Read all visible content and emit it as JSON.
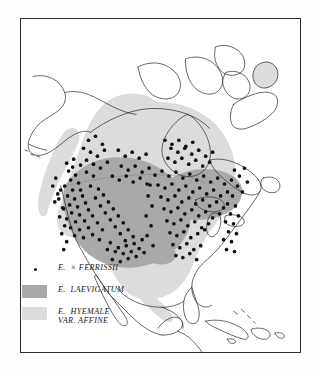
{
  "figure": {
    "type": "distribution-map",
    "region": "North America",
    "background_color": "#fefefe",
    "frame_color": "#2b2b2b",
    "coastline_color": "#333333"
  },
  "colors": {
    "dark_range": "#a9a9a9",
    "light_range": "#dcdcdc",
    "dot": "#111111",
    "land_outline": "#333333",
    "water": "#ffffff"
  },
  "legend": {
    "items": [
      {
        "key_type": "dot",
        "key_color": "#111111",
        "label": "E.  × FERRISSII",
        "label_line2": ""
      },
      {
        "key_type": "swatch",
        "key_color": "#a9a9a9",
        "label": "E.  LAEVIGATUM",
        "label_line2": ""
      },
      {
        "key_type": "swatch",
        "key_color": "#dcdcdc",
        "label": "E.  HYEMALE",
        "label_line2": "VAR. AFFINE"
      }
    ]
  },
  "chart_data": {
    "type": "map",
    "title": "",
    "taxa": [
      {
        "name": "E. × ferrissii",
        "symbol": "dot",
        "count_approx": 185
      },
      {
        "name": "E. laevigatum",
        "symbol": "dark-gray-shading"
      },
      {
        "name": "E. hyemale var. affine",
        "symbol": "light-gray-shading"
      }
    ],
    "dot_points": [
      [
        68,
        171
      ],
      [
        72,
        167
      ],
      [
        75,
        175
      ],
      [
        70,
        180
      ],
      [
        78,
        183
      ],
      [
        64,
        186
      ],
      [
        72,
        190
      ],
      [
        80,
        190
      ],
      [
        67,
        196
      ],
      [
        74,
        199
      ],
      [
        82,
        196
      ],
      [
        69,
        205
      ],
      [
        77,
        207
      ],
      [
        85,
        203
      ],
      [
        63,
        209
      ],
      [
        71,
        213
      ],
      [
        79,
        215
      ],
      [
        88,
        210
      ],
      [
        66,
        219
      ],
      [
        75,
        222
      ],
      [
        84,
        221
      ],
      [
        92,
        216
      ],
      [
        70,
        228
      ],
      [
        79,
        230
      ],
      [
        88,
        228
      ],
      [
        97,
        223
      ],
      [
        74,
        236
      ],
      [
        83,
        238
      ],
      [
        92,
        235
      ],
      [
        66,
        163
      ],
      [
        73,
        159
      ],
      [
        80,
        165
      ],
      [
        86,
        172
      ],
      [
        93,
        176
      ],
      [
        90,
        186
      ],
      [
        98,
        189
      ],
      [
        95,
        198
      ],
      [
        103,
        195
      ],
      [
        100,
        206
      ],
      [
        108,
        202
      ],
      [
        105,
        213
      ],
      [
        113,
        209
      ],
      [
        110,
        220
      ],
      [
        118,
        216
      ],
      [
        115,
        227
      ],
      [
        123,
        223
      ],
      [
        120,
        234
      ],
      [
        128,
        230
      ],
      [
        125,
        241
      ],
      [
        133,
        237
      ],
      [
        102,
        230
      ],
      [
        110,
        243
      ],
      [
        118,
        248
      ],
      [
        126,
        246
      ],
      [
        134,
        244
      ],
      [
        142,
        240
      ],
      [
        99,
        240
      ],
      [
        107,
        250
      ],
      [
        115,
        252
      ],
      [
        123,
        254
      ],
      [
        131,
        252
      ],
      [
        139,
        249
      ],
      [
        112,
        260
      ],
      [
        120,
        262
      ],
      [
        128,
        259
      ],
      [
        136,
        257
      ],
      [
        144,
        253
      ],
      [
        60,
        190
      ],
      [
        58,
        199
      ],
      [
        62,
        208
      ],
      [
        59,
        217
      ],
      [
        64,
        226
      ],
      [
        61,
        234
      ],
      [
        66,
        242
      ],
      [
        63,
        250
      ],
      [
        155,
        175
      ],
      [
        162,
        171
      ],
      [
        169,
        176
      ],
      [
        176,
        172
      ],
      [
        183,
        178
      ],
      [
        190,
        174
      ],
      [
        197,
        180
      ],
      [
        204,
        176
      ],
      [
        211,
        182
      ],
      [
        218,
        178
      ],
      [
        225,
        184
      ],
      [
        232,
        180
      ],
      [
        158,
        185
      ],
      [
        165,
        188
      ],
      [
        172,
        184
      ],
      [
        179,
        190
      ],
      [
        186,
        186
      ],
      [
        193,
        192
      ],
      [
        200,
        188
      ],
      [
        207,
        194
      ],
      [
        214,
        190
      ],
      [
        221,
        196
      ],
      [
        228,
        192
      ],
      [
        161,
        197
      ],
      [
        168,
        200
      ],
      [
        175,
        196
      ],
      [
        182,
        202
      ],
      [
        189,
        198
      ],
      [
        196,
        204
      ],
      [
        203,
        200
      ],
      [
        210,
        206
      ],
      [
        217,
        202
      ],
      [
        224,
        208
      ],
      [
        164,
        209
      ],
      [
        171,
        212
      ],
      [
        178,
        208
      ],
      [
        185,
        214
      ],
      [
        192,
        210
      ],
      [
        199,
        216
      ],
      [
        206,
        212
      ],
      [
        213,
        218
      ],
      [
        220,
        214
      ],
      [
        167,
        221
      ],
      [
        174,
        224
      ],
      [
        181,
        220
      ],
      [
        188,
        226
      ],
      [
        195,
        222
      ],
      [
        202,
        228
      ],
      [
        209,
        224
      ],
      [
        170,
        233
      ],
      [
        177,
        236
      ],
      [
        184,
        232
      ],
      [
        191,
        238
      ],
      [
        198,
        234
      ],
      [
        205,
        230
      ],
      [
        173,
        245
      ],
      [
        180,
        248
      ],
      [
        187,
        244
      ],
      [
        194,
        250
      ],
      [
        201,
        246
      ],
      [
        176,
        256
      ],
      [
        183,
        258
      ],
      [
        190,
        254
      ],
      [
        197,
        260
      ],
      [
        150,
        185
      ],
      [
        148,
        196
      ],
      [
        152,
        206
      ],
      [
        146,
        216
      ],
      [
        151,
        226
      ],
      [
        147,
        236
      ],
      [
        153,
        246
      ],
      [
        235,
        170
      ],
      [
        240,
        176
      ],
      [
        245,
        168
      ],
      [
        238,
        186
      ],
      [
        243,
        192
      ],
      [
        248,
        182
      ],
      [
        233,
        196
      ],
      [
        228,
        204
      ],
      [
        236,
        206
      ],
      [
        231,
        214
      ],
      [
        239,
        216
      ],
      [
        226,
        222
      ],
      [
        234,
        224
      ],
      [
        229,
        232
      ],
      [
        237,
        234
      ],
      [
        224,
        240
      ],
      [
        232,
        242
      ],
      [
        227,
        250
      ],
      [
        235,
        252
      ],
      [
        88,
        140
      ],
      [
        95,
        136
      ],
      [
        102,
        144
      ],
      [
        83,
        148
      ],
      [
        90,
        152
      ],
      [
        97,
        156
      ],
      [
        104,
        150
      ],
      [
        86,
        160
      ],
      [
        93,
        164
      ],
      [
        100,
        168
      ],
      [
        107,
        162
      ],
      [
        118,
        150
      ],
      [
        125,
        156
      ],
      [
        132,
        152
      ],
      [
        139,
        158
      ],
      [
        146,
        154
      ],
      [
        121,
        166
      ],
      [
        128,
        170
      ],
      [
        135,
        166
      ],
      [
        142,
        172
      ],
      [
        149,
        168
      ],
      [
        112,
        176
      ],
      [
        119,
        180
      ],
      [
        126,
        176
      ],
      [
        133,
        182
      ],
      [
        140,
        178
      ],
      [
        147,
        184
      ],
      [
        55,
        178
      ],
      [
        52,
        186
      ],
      [
        57,
        194
      ],
      [
        54,
        202
      ],
      [
        168,
        158
      ],
      [
        175,
        162
      ],
      [
        182,
        158
      ],
      [
        189,
        164
      ],
      [
        196,
        160
      ],
      [
        203,
        166
      ],
      [
        210,
        162
      ],
      [
        171,
        148
      ],
      [
        178,
        152
      ],
      [
        185,
        148
      ],
      [
        192,
        154
      ],
      [
        199,
        150
      ],
      [
        206,
        156
      ],
      [
        213,
        152
      ],
      [
        165,
        140
      ],
      [
        172,
        144
      ],
      [
        179,
        140
      ],
      [
        186,
        146
      ],
      [
        193,
        142
      ]
    ]
  }
}
